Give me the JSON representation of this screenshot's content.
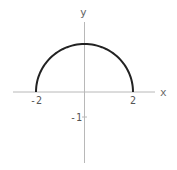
{
  "chart_data": {
    "type": "line",
    "title": "",
    "xlabel": "x",
    "ylabel": "y",
    "function": "y = sqrt(4 - x^2)",
    "xlim": [
      -3.0,
      2.9
    ],
    "ylim": [
      -2.8,
      2.8
    ],
    "grid": false,
    "legend": null,
    "x_ticks": [
      {
        "value": -2,
        "label": "-2"
      },
      {
        "value": 2,
        "label": "2"
      }
    ],
    "y_ticks": [
      {
        "value": -1,
        "label": "-1"
      }
    ],
    "series": [
      {
        "name": "upper semicircle",
        "x": [
          -2,
          -1.8,
          -1.5,
          -1,
          -0.5,
          0,
          0.5,
          1,
          1.5,
          1.8,
          2
        ],
        "y": [
          0,
          0.87,
          1.32,
          1.73,
          1.94,
          2,
          1.94,
          1.73,
          1.32,
          0.87,
          0
        ],
        "color": "#222222"
      }
    ]
  },
  "colors": {
    "axis": "#b0b0b0",
    "curve": "#222222",
    "text": "#555555"
  }
}
